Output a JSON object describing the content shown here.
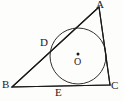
{
  "figure": {
    "kind": "incircle-of-triangle",
    "canvas": {
      "width": 123,
      "height": 101
    },
    "background_color": "#fdfdfb",
    "stroke_color": "#1a1a1a",
    "labels": {
      "vertex_a": "A",
      "vertex_b": "B",
      "vertex_c": "C",
      "point_d": "D",
      "point_e": "E",
      "center_o": "O"
    },
    "points": {
      "A": {
        "x": 99,
        "y": 7
      },
      "B": {
        "x": 12,
        "y": 87
      },
      "C": {
        "x": 110,
        "y": 85
      },
      "D": {
        "x": 53,
        "y": 49
      },
      "E": {
        "x": 60,
        "y": 85
      },
      "O": {
        "x": 78,
        "y": 56
      }
    },
    "circle": {
      "cx": 78,
      "cy": 56,
      "r": 28
    },
    "center_dot": {
      "cx": 78,
      "cy": 54,
      "r": 1.5
    },
    "segments": [
      {
        "name": "side-AB",
        "from": "A",
        "to": "B"
      },
      {
        "name": "side-BC",
        "from": "B",
        "to": "C"
      },
      {
        "name": "side-CA",
        "from": "C",
        "to": "A"
      }
    ]
  }
}
